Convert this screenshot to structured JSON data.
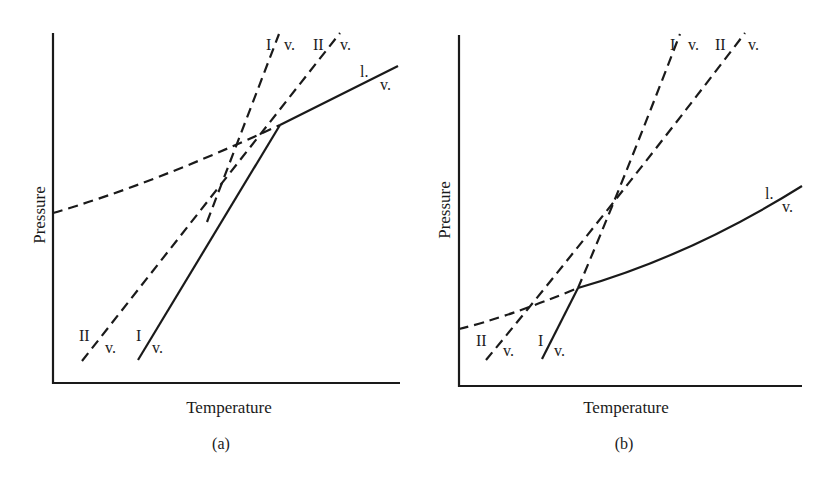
{
  "figure": {
    "type": "phase-diagram-pair",
    "stroke_color": "#1a1a1a",
    "background": "#ffffff"
  },
  "panels": [
    {
      "id": "a",
      "caption": "(a)",
      "x_axis_label": "Temperature",
      "y_axis_label": "Pressure",
      "curves": [
        {
          "name": "I/v",
          "label_top_left": "I",
          "label_top_right": "v.",
          "label_bottom_left": "I",
          "label_bottom_right": "v.",
          "style": "solid below triple point, dashed above"
        },
        {
          "name": "II/v",
          "label_top_left": "II",
          "label_top_right": "v.",
          "label_bottom_left": "II",
          "label_bottom_right": "v.",
          "style": "dashed"
        },
        {
          "name": "l/v",
          "label_top": "l.",
          "label_bottom": "v.",
          "style": "solid above triple point, dashed below"
        }
      ]
    },
    {
      "id": "b",
      "caption": "(b)",
      "x_axis_label": "Temperature",
      "y_axis_label": "Pressure",
      "curves": [
        {
          "name": "I/v",
          "label_top_left": "I",
          "label_top_right": "v.",
          "label_bottom_left": "I",
          "label_bottom_right": "v.",
          "style": "solid below triple point, dashed above"
        },
        {
          "name": "II/v",
          "label_top_left": "II",
          "label_top_right": "v.",
          "label_bottom_left": "II",
          "label_bottom_right": "v.",
          "style": "dashed"
        },
        {
          "name": "l/v",
          "label_top": "l.",
          "label_bottom": "v.",
          "style": "solid above triple point, dashed below"
        }
      ]
    }
  ],
  "text": {
    "a_caption": "(a)",
    "b_caption": "(b)",
    "a_xlabel": "Temperature",
    "a_ylabel": "Pressure",
    "b_xlabel": "Temperature",
    "b_ylabel": "Pressure",
    "I": "I",
    "II": "II",
    "v": "v.",
    "l": "l."
  }
}
